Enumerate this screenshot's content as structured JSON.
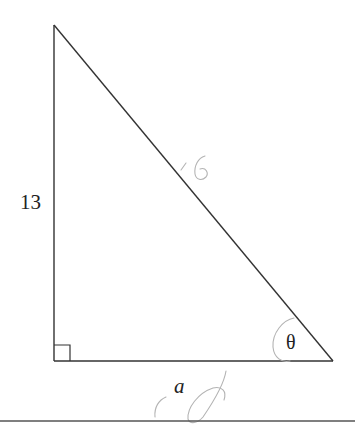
{
  "diagram": {
    "type": "right-triangle",
    "vertices": {
      "top": [
        54,
        25
      ],
      "right_angle": [
        54,
        361
      ],
      "bottom_right": [
        333,
        361
      ]
    },
    "labels": {
      "vertical_leg": "13",
      "horizontal_leg": "a",
      "angle": "θ"
    },
    "handwritten": {
      "hypotenuse_note": "16",
      "note_color": "#a9a9a9"
    },
    "right_angle_marker_size": 16,
    "line_color": "#333333",
    "rule_y": 421
  }
}
